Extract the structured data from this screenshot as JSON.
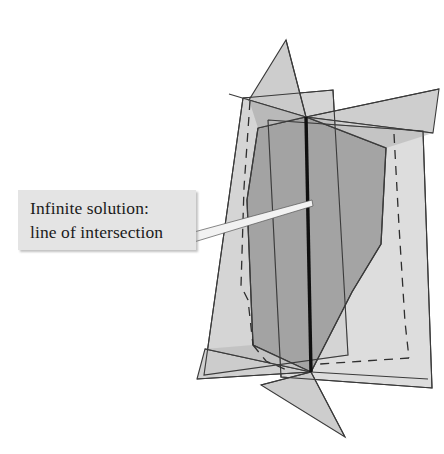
{
  "figure": {
    "callout": {
      "line1": "Infinite solution:",
      "line2": "line of intersection",
      "box_fill": "#e4e4e4",
      "text_color": "#1b1b1b"
    },
    "background": "#ffffff",
    "stroke_color": "#3a3a3a",
    "intersection_line": {
      "name": "line-of-intersection",
      "color": "#101010",
      "width": 3.2,
      "top": [
        305,
        116
      ],
      "bottom": [
        312,
        372
      ]
    },
    "planes": [
      {
        "name": "plane-left-light",
        "fill": "#d0d0d0",
        "opacity": 1,
        "points": "243,98 333,90 348,355 204,375"
      },
      {
        "name": "plane-right-light",
        "fill": "#d0d0d0",
        "opacity": 1,
        "points": "268,120 423,131 432,388 281,377"
      },
      {
        "name": "plane-tall-triangle-upper",
        "fill": "#c4c4c4",
        "opacity": 1,
        "points": "286,40 305,116 253,101"
      },
      {
        "name": "plane-bottom-triangle",
        "fill": "#c8c8c8",
        "opacity": 1,
        "points": "312,372 345,437 262,384"
      },
      {
        "name": "plane-upper-right-wing",
        "fill": "#c4c4c4",
        "opacity": 1,
        "points": "305,116 439,89 430,128"
      },
      {
        "name": "plane-lower-left-wing",
        "fill": "#c8c8c8",
        "opacity": 1,
        "points": "312,372 198,378 207,351"
      },
      {
        "name": "plane-center-dark",
        "fill": "#a6a6a6",
        "opacity": 1,
        "points": "258,128 305,116 383,147 378,245 352,292 312,372 254,344 246,210"
      }
    ],
    "dashed_edges": [
      {
        "name": "dashed-edge-left",
        "points": "253,101 244,184 240,292 247,334 263,384"
      },
      {
        "name": "dashed-edge-right",
        "points": "393,133 398,222 404,318 410,356 281,377"
      }
    ],
    "leader": {
      "name": "callout-leader",
      "fill": "#f4f4f4",
      "points": "196,234 310,202 312,207 196,243"
    }
  }
}
